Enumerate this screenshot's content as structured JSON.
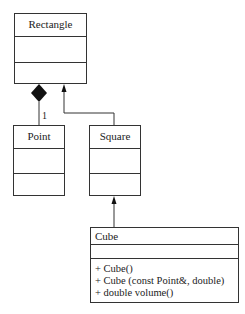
{
  "diagram": {
    "type": "UML class diagram",
    "classes": [
      {
        "name": "Rectangle",
        "attributes": [],
        "operations": []
      },
      {
        "name": "Point",
        "attributes": [],
        "operations": []
      },
      {
        "name": "Square",
        "attributes": [],
        "operations": []
      },
      {
        "name": "Cube",
        "attributes": [],
        "operations": [
          "+ Cube()",
          "+ Cube (const Point&, double)",
          "+ double volume()"
        ]
      }
    ],
    "relationships": [
      {
        "type": "composition",
        "whole": "Rectangle",
        "part": "Point",
        "multiplicity": "1"
      },
      {
        "type": "generalization",
        "child": "Square",
        "parent": "Rectangle"
      },
      {
        "type": "generalization",
        "child": "Cube",
        "parent": "Square"
      }
    ]
  }
}
